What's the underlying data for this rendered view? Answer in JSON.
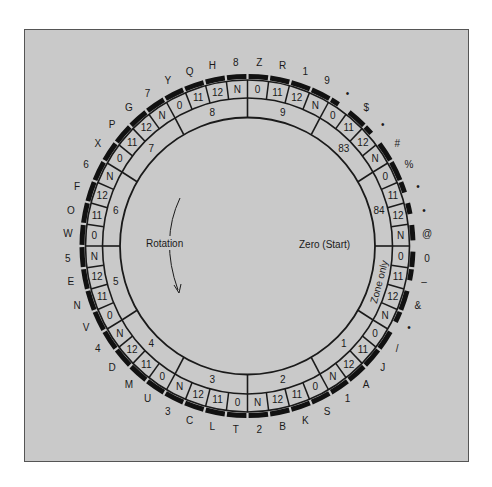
{
  "diagram": {
    "title": "",
    "center_labels": {
      "rotation": "Rotation",
      "zero_start": "Zero (Start)"
    },
    "colors": {
      "panel_background": "#c9c9c9",
      "line": "#1a1a1a",
      "bar": "#111111"
    },
    "cells": [
      {
        "row": "0",
        "char": "Z",
        "bar": [
          0.05,
          0.95
        ]
      },
      {
        "row": "11",
        "char": "R",
        "bar": [
          0.05,
          0.95
        ]
      },
      {
        "row": "12",
        "char": "1",
        "bar": [
          0.05,
          0.95
        ]
      },
      {
        "row": "N",
        "char": "9",
        "bar": [
          0.05,
          0.95
        ]
      },
      {
        "row": "0",
        "char": "•",
        "bar": [
          0.05,
          0.45
        ]
      },
      {
        "row": "11",
        "char": "$",
        "bar": [
          0.05,
          0.95
        ]
      },
      {
        "row": "12",
        "char": "•",
        "bar": [
          0.05,
          0.45
        ]
      },
      {
        "row": "N",
        "char": "#",
        "bar": [
          0.05,
          0.95
        ]
      },
      {
        "row": "0",
        "char": "%",
        "bar": [
          0.05,
          0.95
        ]
      },
      {
        "row": "11",
        "char": "•",
        "bar": [
          0.05,
          0.55
        ]
      },
      {
        "row": "12",
        "char": "•",
        "bar": [
          0.05,
          0.55
        ]
      },
      {
        "row": "N",
        "char": "@",
        "bar": [
          0.05,
          0.75
        ]
      },
      {
        "row": "0",
        "char": "0",
        "bar": [
          0.25,
          0.95
        ]
      },
      {
        "row": "11",
        "char": "–",
        "bar": [
          0.05,
          0.55
        ]
      },
      {
        "row": "12",
        "char": "&",
        "bar": [
          0.05,
          0.95
        ]
      },
      {
        "row": "N",
        "char": "•",
        "bar": [
          0.05,
          0.55
        ]
      },
      {
        "row": "0",
        "char": "/",
        "bar": [
          0.05,
          0.95
        ]
      },
      {
        "row": "11",
        "char": "J",
        "bar": [
          0.05,
          0.95
        ]
      },
      {
        "row": "12",
        "char": "A",
        "bar": [
          0.05,
          0.95
        ]
      },
      {
        "row": "N",
        "char": "1",
        "bar": [
          0.05,
          0.95
        ]
      },
      {
        "row": "0",
        "char": "S",
        "bar": [
          0.05,
          0.95
        ]
      },
      {
        "row": "11",
        "char": "K",
        "bar": [
          0.05,
          0.95
        ]
      },
      {
        "row": "12",
        "char": "B",
        "bar": [
          0.05,
          0.95
        ]
      },
      {
        "row": "N",
        "char": "2",
        "bar": [
          0.05,
          0.95
        ]
      },
      {
        "row": "0",
        "char": "T",
        "bar": [
          0.05,
          0.95
        ]
      },
      {
        "row": "11",
        "char": "L",
        "bar": [
          0.05,
          0.95
        ]
      },
      {
        "row": "12",
        "char": "C",
        "bar": [
          0.05,
          0.95
        ]
      },
      {
        "row": "N",
        "char": "3",
        "bar": [
          0.05,
          0.95
        ]
      },
      {
        "row": "0",
        "char": "U",
        "bar": [
          0.05,
          0.95
        ]
      },
      {
        "row": "11",
        "char": "M",
        "bar": [
          0.05,
          0.95
        ]
      },
      {
        "row": "12",
        "char": "D",
        "bar": [
          0.05,
          0.95
        ]
      },
      {
        "row": "N",
        "char": "4",
        "bar": [
          0.05,
          0.95
        ]
      },
      {
        "row": "0",
        "char": "V",
        "bar": [
          0.05,
          0.95
        ]
      },
      {
        "row": "11",
        "char": "N",
        "bar": [
          0.05,
          0.95
        ]
      },
      {
        "row": "12",
        "char": "E",
        "bar": [
          0.05,
          0.95
        ]
      },
      {
        "row": "N",
        "char": "5",
        "bar": [
          0.05,
          0.95
        ]
      },
      {
        "row": "0",
        "char": "W",
        "bar": [
          0.05,
          0.95
        ]
      },
      {
        "row": "11",
        "char": "O",
        "bar": [
          0.05,
          0.95
        ]
      },
      {
        "row": "12",
        "char": "F",
        "bar": [
          0.05,
          0.95
        ]
      },
      {
        "row": "N",
        "char": "6",
        "bar": [
          0.05,
          0.95
        ]
      },
      {
        "row": "0",
        "char": "X",
        "bar": [
          0.05,
          0.95
        ]
      },
      {
        "row": "11",
        "char": "P",
        "bar": [
          0.05,
          0.95
        ]
      },
      {
        "row": "12",
        "char": "G",
        "bar": [
          0.05,
          0.95
        ]
      },
      {
        "row": "N",
        "char": "7",
        "bar": [
          0.05,
          0.95
        ]
      },
      {
        "row": "0",
        "char": "Y",
        "bar": [
          0.05,
          0.95
        ]
      },
      {
        "row": "11",
        "char": "Q",
        "bar": [
          0.05,
          0.95
        ]
      },
      {
        "row": "12",
        "char": "H",
        "bar": [
          0.05,
          0.95
        ]
      },
      {
        "row": "N",
        "char": "8",
        "bar": [
          0.05,
          0.95
        ]
      }
    ],
    "zones": [
      {
        "label": "9"
      },
      {
        "label": "83"
      },
      {
        "label": "84"
      },
      {
        "label": "Zone only"
      },
      {
        "label": "1"
      },
      {
        "label": "2"
      },
      {
        "label": "3"
      },
      {
        "label": "4"
      },
      {
        "label": "5"
      },
      {
        "label": "6"
      },
      {
        "label": "7"
      },
      {
        "label": "8"
      }
    ]
  }
}
